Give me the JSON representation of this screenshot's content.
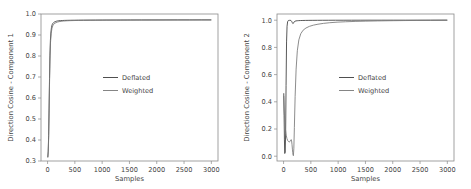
{
  "figure": {
    "background_color": "#ffffff",
    "frame_color": "#8a8a8a",
    "text_color": "#444444"
  },
  "chart_data": [
    {
      "type": "line",
      "title": "",
      "xlabel": "Samples",
      "ylabel": "Direction Cosine - Component 1",
      "xlim": [
        -120,
        3120
      ],
      "ylim": [
        0.28,
        1.03
      ],
      "xticks": [
        0,
        500,
        1000,
        1500,
        2000,
        2500,
        3000
      ],
      "xticklabels": [
        "0",
        "500",
        "1000",
        "1500",
        "2000",
        "2500",
        "3000"
      ],
      "yticks": [
        0.3,
        0.4,
        0.5,
        0.6,
        0.7,
        0.8,
        0.9,
        1.0
      ],
      "yticklabels": [
        "0.3",
        "0.4",
        "0.5",
        "0.6",
        "0.7",
        "0.8",
        "0.9",
        "1.0"
      ],
      "grid": false,
      "legend_position": "center",
      "series": [
        {
          "name": "Deflated",
          "color": "#3b3b3b",
          "x": [
            5,
            12,
            20,
            28,
            36,
            44,
            52,
            62,
            72,
            84,
            96,
            110,
            125,
            140,
            160,
            180,
            205,
            235,
            270,
            310,
            360,
            420,
            490,
            570,
            660,
            760,
            880,
            1010,
            1160,
            1330,
            1520,
            1720,
            1930,
            2150,
            2380,
            2600,
            2820,
            2990
          ],
          "y": [
            0.302,
            0.33,
            0.41,
            0.55,
            0.7,
            0.82,
            0.895,
            0.938,
            0.962,
            0.975,
            0.982,
            0.986,
            0.989,
            0.991,
            0.993,
            0.9945,
            0.9955,
            0.9962,
            0.9968,
            0.9973,
            0.9977,
            0.998,
            0.9983,
            0.9985,
            0.9987,
            0.9989,
            0.999,
            0.9992,
            0.9993,
            0.9994,
            0.9995,
            0.9996,
            0.9997,
            0.9997,
            0.9998,
            0.9998,
            0.9999,
            0.9999
          ]
        },
        {
          "name": "Weighted",
          "color": "#777777",
          "x": [
            5,
            12,
            20,
            28,
            36,
            44,
            54,
            66,
            80,
            96,
            114,
            134,
            156,
            182,
            212,
            248,
            290,
            340,
            400,
            475,
            560,
            660,
            780,
            920,
            1080,
            1260,
            1460,
            1680,
            1910,
            2150,
            2400,
            2650,
            2880,
            2990
          ],
          "y": [
            0.299,
            0.322,
            0.395,
            0.525,
            0.675,
            0.8,
            0.884,
            0.93,
            0.956,
            0.97,
            0.978,
            0.983,
            0.986,
            0.989,
            0.991,
            0.9928,
            0.9941,
            0.9951,
            0.9959,
            0.9966,
            0.9971,
            0.9976,
            0.998,
            0.9983,
            0.9986,
            0.9988,
            0.999,
            0.9992,
            0.9993,
            0.9995,
            0.9996,
            0.9997,
            0.9998,
            0.9998
          ]
        }
      ]
    },
    {
      "type": "line",
      "title": "",
      "xlabel": "Samples",
      "ylabel": "Direction Cosine - Component 2",
      "xlim": [
        -120,
        3120
      ],
      "ylim": [
        -0.035,
        1.045
      ],
      "xticks": [
        0,
        500,
        1000,
        1500,
        2000,
        2500,
        3000
      ],
      "xticklabels": [
        "0",
        "500",
        "1000",
        "1500",
        "2000",
        "2500",
        "3000"
      ],
      "yticks": [
        0.0,
        0.2,
        0.4,
        0.6,
        0.8,
        1.0
      ],
      "yticklabels": [
        "0.0",
        "0.2",
        "0.4",
        "0.6",
        "0.8",
        "1.0"
      ],
      "grid": false,
      "legend_position": "center",
      "series": [
        {
          "name": "Deflated",
          "color": "#3b3b3b",
          "x": [
            4,
            10,
            16,
            22,
            30,
            38,
            46,
            55,
            64,
            74,
            85,
            96,
            108,
            122,
            136,
            148,
            158,
            166,
            172,
            178,
            186,
            196,
            210,
            228,
            250,
            278,
            312,
            354,
            404,
            464,
            536,
            620,
            716,
            826,
            950,
            1090,
            1245,
            1415,
            1600,
            1800,
            2010,
            2230,
            2460,
            2690,
            2900,
            2990
          ],
          "y": [
            0.46,
            0.3,
            0.12,
            0.02,
            0.03,
            0.17,
            0.52,
            0.84,
            0.955,
            0.988,
            0.996,
            0.998,
            0.9985,
            0.9985,
            0.997,
            0.991,
            0.983,
            0.977,
            0.974,
            0.976,
            0.982,
            0.988,
            0.992,
            0.9942,
            0.9955,
            0.9964,
            0.997,
            0.9975,
            0.9979,
            0.9982,
            0.9985,
            0.9987,
            0.9989,
            0.9991,
            0.9992,
            0.9993,
            0.9994,
            0.9995,
            0.9996,
            0.9996,
            0.9997,
            0.9997,
            0.9998,
            0.9998,
            0.9999,
            0.9999
          ]
        },
        {
          "name": "Weighted",
          "color": "#777777",
          "x": [
            4,
            12,
            22,
            34,
            48,
            62,
            76,
            90,
            104,
            118,
            130,
            140,
            148,
            155,
            162,
            168,
            174,
            180,
            188,
            198,
            212,
            230,
            252,
            280,
            315,
            358,
            410,
            472,
            545,
            630,
            730,
            845,
            980,
            1135,
            1310,
            1505,
            1720,
            1950,
            2190,
            2440,
            2690,
            2900,
            2990
          ],
          "y": [
            0.44,
            0.34,
            0.26,
            0.2,
            0.155,
            0.13,
            0.115,
            0.108,
            0.105,
            0.108,
            0.118,
            0.122,
            0.112,
            0.085,
            0.052,
            0.026,
            0.01,
            0.004,
            0.055,
            0.21,
            0.44,
            0.64,
            0.775,
            0.855,
            0.9,
            0.926,
            0.942,
            0.954,
            0.963,
            0.97,
            0.976,
            0.981,
            0.985,
            0.988,
            0.9905,
            0.9925,
            0.9942,
            0.9956,
            0.9967,
            0.9976,
            0.9984,
            0.999,
            0.9992
          ]
        }
      ]
    }
  ],
  "legend": {
    "items": [
      {
        "label": "Deflated",
        "color": "#3b3b3b"
      },
      {
        "label": "Weighted",
        "color": "#777777"
      }
    ]
  }
}
